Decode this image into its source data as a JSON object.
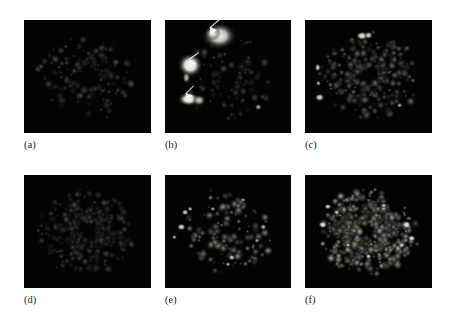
{
  "figure": {
    "type": "micrograph-panel-grid",
    "rows": 2,
    "columns": 3,
    "background_color": "#ffffff",
    "panel_background_color": "#030303",
    "label_color": "#1a1a1a",
    "marker_color": "#f4f4f4"
  },
  "panels": [
    {
      "id": "a",
      "label": "(a)",
      "row": 0,
      "column": 0,
      "x": 24,
      "y": 20,
      "width": 127,
      "height": 113,
      "label_x": 24,
      "label_y": 139,
      "brightness": "very-low",
      "description": "faint sparse speckle ring",
      "seed": 11,
      "dot_count": 150,
      "max_intensity": 0.32,
      "arrowheads": []
    },
    {
      "id": "b",
      "label": "(b)",
      "row": 0,
      "column": 1,
      "x": 165,
      "y": 20,
      "width": 126,
      "height": 113,
      "label_x": 165,
      "label_y": 139,
      "brightness": "high-contrast-clusters",
      "description": "three bright clusters indicated by arrowheads",
      "seed": 23,
      "dot_count": 90,
      "max_intensity": 0.3,
      "blobs": [
        {
          "x": 0.43,
          "y": 0.14,
          "rx": 0.075,
          "ry": 0.065,
          "intensity": 0.82
        },
        {
          "x": 0.38,
          "y": 0.12,
          "rx": 0.035,
          "ry": 0.035,
          "intensity": 0.7
        },
        {
          "x": 0.2,
          "y": 0.4,
          "rx": 0.055,
          "ry": 0.06,
          "intensity": 0.95
        },
        {
          "x": 0.17,
          "y": 0.51,
          "rx": 0.018,
          "ry": 0.03,
          "intensity": 0.55
        },
        {
          "x": 0.19,
          "y": 0.7,
          "rx": 0.05,
          "ry": 0.035,
          "intensity": 0.92
        },
        {
          "x": 0.27,
          "y": 0.71,
          "rx": 0.03,
          "ry": 0.028,
          "intensity": 0.6
        },
        {
          "x": 0.74,
          "y": 0.77,
          "rx": 0.016,
          "ry": 0.016,
          "intensity": 0.5
        }
      ],
      "arrowheads": [
        {
          "x": 0.345,
          "y": 0.075,
          "rotation": 205,
          "tail_length": 13
        },
        {
          "x": 0.175,
          "y": 0.36,
          "rotation": 210,
          "tail_length": 12
        },
        {
          "x": 0.15,
          "y": 0.655,
          "rotation": 200,
          "tail_length": 11
        }
      ]
    },
    {
      "id": "c",
      "label": "(c)",
      "row": 0,
      "column": 2,
      "x": 305,
      "y": 20,
      "width": 127,
      "height": 113,
      "label_x": 305,
      "label_y": 139,
      "brightness": "low-medium",
      "description": "dispersed punctate ring with small bright foci at left",
      "seed": 37,
      "dot_count": 260,
      "max_intensity": 0.46,
      "blobs": [
        {
          "x": 0.45,
          "y": 0.14,
          "rx": 0.028,
          "ry": 0.022,
          "intensity": 0.78
        },
        {
          "x": 0.5,
          "y": 0.135,
          "rx": 0.02,
          "ry": 0.02,
          "intensity": 0.66
        },
        {
          "x": 0.1,
          "y": 0.42,
          "rx": 0.013,
          "ry": 0.02,
          "intensity": 0.7
        },
        {
          "x": 0.105,
          "y": 0.56,
          "rx": 0.011,
          "ry": 0.014,
          "intensity": 0.58
        },
        {
          "x": 0.115,
          "y": 0.685,
          "rx": 0.022,
          "ry": 0.02,
          "intensity": 0.72
        },
        {
          "x": 0.745,
          "y": 0.755,
          "rx": 0.013,
          "ry": 0.013,
          "intensity": 0.52
        }
      ],
      "arrowheads": []
    },
    {
      "id": "d",
      "label": "(d)",
      "row": 1,
      "column": 0,
      "x": 24,
      "y": 175,
      "width": 127,
      "height": 113,
      "label_x": 24,
      "label_y": 294,
      "brightness": "very-low",
      "description": "faint diffuse speckle network",
      "seed": 53,
      "dot_count": 310,
      "max_intensity": 0.3,
      "arrowheads": []
    },
    {
      "id": "e",
      "label": "(e)",
      "row": 1,
      "column": 1,
      "x": 165,
      "y": 175,
      "width": 126,
      "height": 113,
      "label_x": 165,
      "label_y": 294,
      "brightness": "medium",
      "description": "scattered discrete bright puncta around a ring",
      "seed": 71,
      "dot_count": 120,
      "max_intensity": 0.6,
      "blobs": [
        {
          "x": 0.16,
          "y": 0.33,
          "rx": 0.016,
          "ry": 0.016,
          "intensity": 0.66
        },
        {
          "x": 0.2,
          "y": 0.3,
          "rx": 0.012,
          "ry": 0.012,
          "intensity": 0.58
        },
        {
          "x": 0.13,
          "y": 0.46,
          "rx": 0.02,
          "ry": 0.018,
          "intensity": 0.74
        },
        {
          "x": 0.075,
          "y": 0.55,
          "rx": 0.012,
          "ry": 0.012,
          "intensity": 0.5
        },
        {
          "x": 0.38,
          "y": 0.3,
          "rx": 0.012,
          "ry": 0.012,
          "intensity": 0.55
        },
        {
          "x": 0.62,
          "y": 0.22,
          "rx": 0.011,
          "ry": 0.011,
          "intensity": 0.5
        },
        {
          "x": 0.78,
          "y": 0.46,
          "rx": 0.014,
          "ry": 0.014,
          "intensity": 0.6
        },
        {
          "x": 0.73,
          "y": 0.58,
          "rx": 0.012,
          "ry": 0.012,
          "intensity": 0.52
        },
        {
          "x": 0.53,
          "y": 0.73,
          "rx": 0.016,
          "ry": 0.016,
          "intensity": 0.62
        },
        {
          "x": 0.5,
          "y": 0.79,
          "rx": 0.012,
          "ry": 0.012,
          "intensity": 0.55
        }
      ],
      "arrowheads": []
    },
    {
      "id": "f",
      "label": "(f)",
      "row": 1,
      "column": 2,
      "x": 305,
      "y": 175,
      "width": 127,
      "height": 113,
      "label_x": 305,
      "label_y": 294,
      "brightness": "high",
      "description": "dense bright punctate staining filling the field",
      "seed": 97,
      "dot_count": 520,
      "max_intensity": 0.72,
      "blobs": [
        {
          "x": 0.14,
          "y": 0.44,
          "rx": 0.02,
          "ry": 0.018,
          "intensity": 0.8
        },
        {
          "x": 0.18,
          "y": 0.28,
          "rx": 0.016,
          "ry": 0.014,
          "intensity": 0.72
        },
        {
          "x": 0.25,
          "y": 0.33,
          "rx": 0.013,
          "ry": 0.013,
          "intensity": 0.68
        },
        {
          "x": 0.8,
          "y": 0.44,
          "rx": 0.02,
          "ry": 0.02,
          "intensity": 0.82
        },
        {
          "x": 0.84,
          "y": 0.56,
          "rx": 0.018,
          "ry": 0.016,
          "intensity": 0.76
        },
        {
          "x": 0.76,
          "y": 0.62,
          "rx": 0.014,
          "ry": 0.014,
          "intensity": 0.7
        },
        {
          "x": 0.5,
          "y": 0.72,
          "rx": 0.014,
          "ry": 0.014,
          "intensity": 0.66
        },
        {
          "x": 0.62,
          "y": 0.27,
          "rx": 0.014,
          "ry": 0.012,
          "intensity": 0.66
        },
        {
          "x": 0.34,
          "y": 0.62,
          "rx": 0.012,
          "ry": 0.012,
          "intensity": 0.6
        }
      ],
      "arrowheads": []
    }
  ]
}
